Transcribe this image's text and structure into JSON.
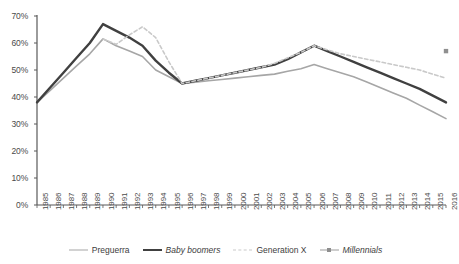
{
  "chart_data": {
    "type": "line",
    "title": "",
    "xlabel": "",
    "ylabel": "",
    "ylim": [
      0,
      0.7
    ],
    "ytick_labels": [
      "0%",
      "10%",
      "20%",
      "30%",
      "40%",
      "50%",
      "60%",
      "70%"
    ],
    "ytick_values": [
      0,
      10,
      20,
      30,
      40,
      50,
      60,
      70
    ],
    "grid": false,
    "legend_position": "bottom",
    "x": [
      1985,
      1986,
      1987,
      1988,
      1989,
      1990,
      1991,
      1992,
      1993,
      1994,
      1995,
      1996,
      1997,
      1998,
      1999,
      2000,
      2001,
      2002,
      2003,
      2004,
      2005,
      2006,
      2007,
      2008,
      2009,
      2010,
      2011,
      2012,
      2013,
      2014,
      2015,
      2016
    ],
    "categories": [
      "1985",
      "1986",
      "1987",
      "1988",
      "1989",
      "1990",
      "1991",
      "1992",
      "1993",
      "1994",
      "1995",
      "1996",
      "1997",
      "1998",
      "1999",
      "2000",
      "2001",
      "2002",
      "2003",
      "2004",
      "2005",
      "2006",
      "2007",
      "2008",
      "2009",
      "2010",
      "2011",
      "2012",
      "2013",
      "2014",
      "2015",
      "2016"
    ],
    "series": [
      {
        "name": "Preguerra",
        "style": "solid",
        "color": "#a6a6a6",
        "width": 1.6,
        "values": [
          38,
          42.5,
          47,
          51.5,
          56,
          61.5,
          59,
          57,
          55,
          50,
          47.5,
          45,
          45.5,
          46,
          46.5,
          47,
          47.5,
          48,
          48.5,
          49.5,
          50.5,
          52,
          50.5,
          49,
          47.5,
          45.5,
          43.5,
          41.5,
          39.5,
          37,
          34.5,
          32
        ]
      },
      {
        "name": "Baby boomers",
        "style": "solid",
        "color": "#404040",
        "width": 2.4,
        "values": [
          38,
          43.5,
          49,
          54.5,
          60,
          67,
          64.5,
          62,
          59,
          53.5,
          49,
          45,
          46,
          47,
          48,
          49,
          50,
          51,
          52,
          54,
          56.5,
          59,
          57,
          55,
          53,
          51,
          49,
          47,
          45,
          43,
          40.5,
          38
        ]
      },
      {
        "name": "Generation X",
        "style": "dashed",
        "color": "#c9c9c9",
        "width": 1.6,
        "values": [
          null,
          null,
          null,
          null,
          null,
          61.5,
          59.5,
          63,
          66,
          62,
          53,
          45,
          46,
          47,
          48,
          49,
          50,
          51,
          52.5,
          54.5,
          56.5,
          59,
          57.5,
          56,
          55,
          54,
          53,
          52,
          51,
          50,
          48.5,
          47
        ]
      },
      {
        "name": "Millennials",
        "style": "marker",
        "color": "#8f8f8f",
        "width": 1.6,
        "values": [
          null,
          null,
          null,
          null,
          null,
          null,
          null,
          null,
          null,
          null,
          null,
          null,
          null,
          null,
          null,
          null,
          null,
          null,
          null,
          null,
          null,
          null,
          null,
          null,
          null,
          null,
          null,
          null,
          null,
          null,
          null,
          57
        ]
      }
    ]
  },
  "legend": {
    "items": [
      {
        "label": "Preguerra",
        "italic": false
      },
      {
        "label": "Baby boomers",
        "italic": true
      },
      {
        "label": "Generation X",
        "italic": false
      },
      {
        "label": "Millennials",
        "italic": true
      }
    ]
  },
  "axis": {
    "line_color": "#595959"
  }
}
